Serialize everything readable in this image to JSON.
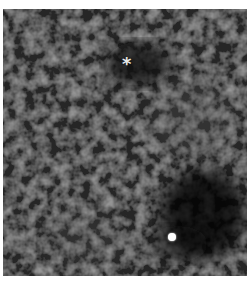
{
  "image": {
    "description": "Grayscale microscopy-style textured image with annotation markers",
    "background_color": "#2a2a2a"
  },
  "markers": {
    "asterisk": {
      "symbol": "*",
      "color": "#e8e8e8"
    },
    "dot": {
      "color": "#ffffff"
    }
  },
  "caption": {
    "text": ""
  }
}
